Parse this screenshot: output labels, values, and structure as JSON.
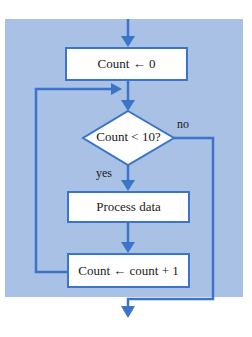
{
  "diagram": {
    "type": "flowchart",
    "nodes": [
      {
        "id": "init",
        "shape": "process",
        "label": "Count ← 0"
      },
      {
        "id": "test",
        "shape": "decision",
        "label": "Count < 10?"
      },
      {
        "id": "process",
        "shape": "process",
        "label": "Process data"
      },
      {
        "id": "increment",
        "shape": "process",
        "label": "Count ← count + 1"
      }
    ],
    "edges": [
      {
        "from": "start",
        "to": "init"
      },
      {
        "from": "init",
        "to": "test"
      },
      {
        "from": "test",
        "to": "process",
        "label": "yes"
      },
      {
        "from": "process",
        "to": "increment"
      },
      {
        "from": "increment",
        "to": "test",
        "label": ""
      },
      {
        "from": "test",
        "to": "exit",
        "label": "no"
      }
    ],
    "labels": {
      "yes": "yes",
      "no": "no"
    },
    "colors": {
      "panel": "#a9c1e4",
      "line": "#3b74c8",
      "box_fill": "#ffffff"
    }
  }
}
